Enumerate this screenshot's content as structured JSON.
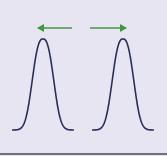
{
  "diagram": {
    "colors": {
      "background": "#e6e5f1",
      "curve": "#2c2f5e",
      "arrow": "#3f9a3f",
      "baseline": "#6f6f78"
    },
    "curves": [
      {
        "name": "left-curve",
        "peak_x": 43,
        "peak_y": 39,
        "base_left": 12,
        "base_right": 74,
        "base_y": 130
      },
      {
        "name": "right-curve",
        "peak_x": 123,
        "peak_y": 39,
        "base_left": 92,
        "base_right": 154,
        "base_y": 130
      }
    ],
    "arrows": [
      {
        "name": "left-arrow",
        "direction": "left",
        "from_x": 72,
        "to_x": 38,
        "y": 28
      },
      {
        "name": "right-arrow",
        "direction": "right",
        "from_x": 90,
        "to_x": 126,
        "y": 28
      }
    ]
  }
}
